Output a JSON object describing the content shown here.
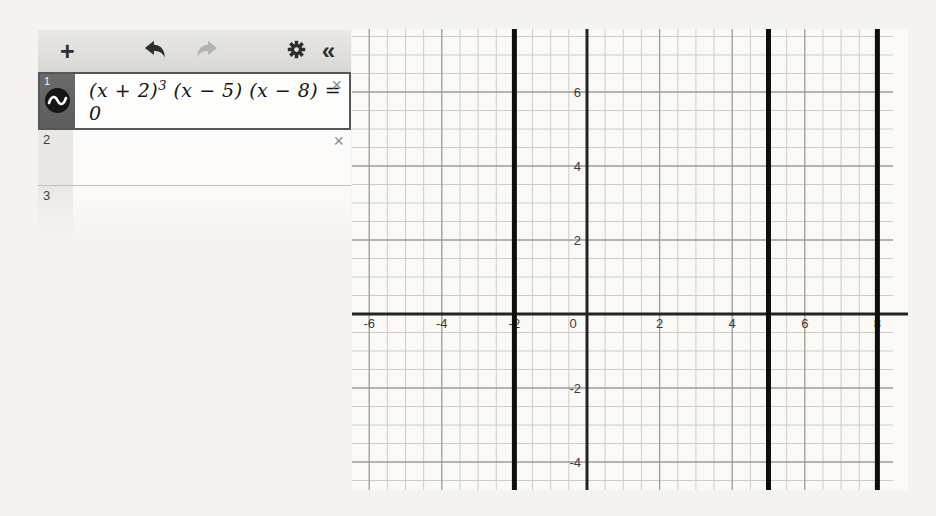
{
  "toolbar": {
    "add_label": "+",
    "collapse_label": "«"
  },
  "expressions": [
    {
      "index": "1",
      "formula": {
        "base": "(x + 2)",
        "exponent": "3",
        "rest": " (x − 5) (x − 8) = 0"
      },
      "text": "(x + 2)³ (x − 5) (x − 8) = 0",
      "close_label": "×"
    },
    {
      "index": "2",
      "value": "",
      "close_label": "×"
    },
    {
      "index": "3",
      "value": ""
    }
  ],
  "graph": {
    "width": 556,
    "height": 461,
    "grid_right": 541,
    "origin": {
      "x": 235,
      "y": 285
    },
    "unit": {
      "x": 36.3,
      "y": 37
    },
    "minor_step": 0.5,
    "major_step": 2,
    "x_axis_labels": [
      -6,
      -4,
      -2,
      0,
      2,
      4,
      6,
      8
    ],
    "y_axis_labels": [
      6,
      4,
      2,
      -2,
      -4
    ],
    "solution_lines": [
      -2,
      5,
      8
    ],
    "colors": {
      "minor": "#cdccca",
      "major": "#9c9b98",
      "axis": "#242424",
      "solution": "#0f0f0f",
      "label": "#3b3b3b"
    }
  }
}
